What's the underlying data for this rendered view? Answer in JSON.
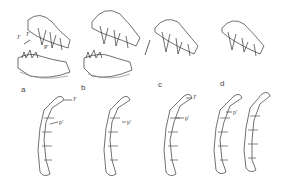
{
  "figure": {
    "panels": [
      {
        "letter": "a",
        "top_labels": [
          "J'",
          "J'",
          "P'"
        ],
        "bottom_labels": [
          "J'",
          "p'"
        ]
      },
      {
        "letter": "b",
        "top_labels": [],
        "bottom_labels": [
          "p'"
        ]
      },
      {
        "letter": "c",
        "top_labels": [],
        "bottom_labels": [
          "J'",
          "p'"
        ]
      },
      {
        "letter": "d",
        "top_labels": [],
        "bottom_labels": [
          "p'"
        ]
      }
    ]
  }
}
